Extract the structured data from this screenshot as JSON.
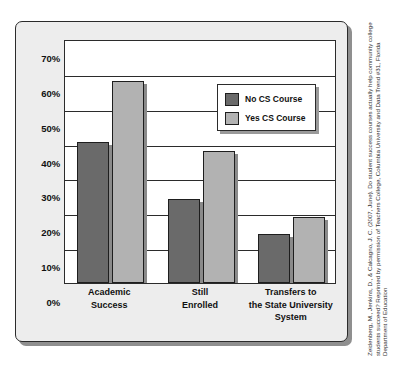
{
  "figure": {
    "citation": "Zeidenberg, M., Jenkins, D., & Calcagno, J. C. (2007, June). Do student success courses actually help community college students succeed? Reprinted by permission of Teachers College, Columbia University and Data Trend #31, Florida Department of Education"
  },
  "legend": {
    "items": [
      {
        "label": "No CS Course",
        "color": "#6a6a6a"
      },
      {
        "label": "Yes CS Course",
        "color": "#b2b2b2"
      }
    ]
  },
  "chart_data": {
    "type": "bar",
    "title": "",
    "subtitle": "",
    "xlabel": "",
    "ylabel": "",
    "categories": [
      "Academic\nSuccess",
      "Still\nEnrolled",
      "Transfers to\nthe State University\nSystem"
    ],
    "series": [
      {
        "name": "No CS Course",
        "color": "#6a6a6a",
        "values": [
          40.5,
          24.0,
          14.0
        ]
      },
      {
        "name": "Yes CS Course",
        "color": "#b2b2b2",
        "values": [
          58.0,
          38.0,
          19.0
        ]
      }
    ],
    "ylim": [
      0,
      70
    ],
    "yticks": [
      0,
      10,
      20,
      30,
      40,
      50,
      60,
      70
    ],
    "ytick_labels": [
      "0%",
      "10%",
      "20%",
      "30%",
      "40%",
      "50%",
      "60%",
      "70%"
    ],
    "grid": true,
    "grid_axis": "y",
    "legend_position": "upper right"
  }
}
